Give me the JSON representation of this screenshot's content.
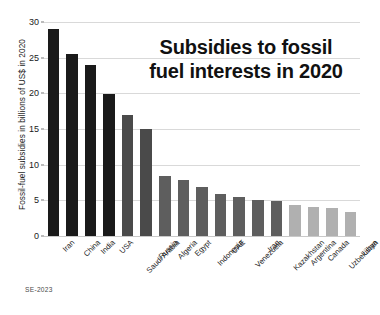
{
  "chart_data": {
    "type": "bar",
    "title_lines": [
      "Subsidies to fossil",
      "fuel interests in 2020"
    ],
    "xlabel": "",
    "ylabel": "Fossil-fuel subsidies in billions of US$ in 2020",
    "ylim": [
      0,
      30
    ],
    "yticks": [
      0,
      5,
      10,
      15,
      20,
      25,
      30
    ],
    "ytick_labels": [
      "0",
      "5",
      "10",
      "15",
      "20",
      "25",
      "30"
    ],
    "grid": true,
    "legend": false,
    "categories": [
      "Iran",
      "China",
      "India",
      "USA",
      "Saudi Arabia",
      "Russia",
      "Algeria",
      "Egypt",
      "Indonesia",
      "UAE",
      "Venezuela",
      "Iraq",
      "Kazakhstan",
      "Argentina",
      "Canada",
      "Uzbekistan",
      "Libya"
    ],
    "values": [
      29.0,
      25.5,
      24.0,
      19.9,
      17.0,
      15.0,
      8.4,
      7.9,
      6.9,
      5.9,
      5.4,
      5.0,
      4.9,
      4.4,
      4.1,
      3.9,
      3.4
    ],
    "bar_colors": [
      "#1a1a1a",
      "#1a1a1a",
      "#1a1a1a",
      "#1a1a1a",
      "#4a4a4a",
      "#4a4a4a",
      "#5e5e5e",
      "#5e5e5e",
      "#5e5e5e",
      "#5e5e5e",
      "#5e5e5e",
      "#5e5e5e",
      "#5e5e5e",
      "#b0b0b0",
      "#b0b0b0",
      "#b0b0b0",
      "#b0b0b0"
    ]
  },
  "credit": {
    "text": "SE-2023"
  },
  "colors": {
    "dark_bar": "#1a1a1a",
    "mid_bar": "#5e5e5e",
    "light_bar": "#b0b0b0",
    "gridline": "#d9d9d9",
    "text": "#111111",
    "background": "#ffffff"
  }
}
